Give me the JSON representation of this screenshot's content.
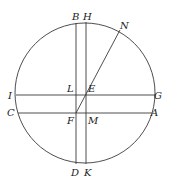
{
  "diagram": {
    "type": "geometric-construction",
    "circle": {
      "cx": 85,
      "cy": 93,
      "r": 70
    },
    "lines": [
      {
        "id": "BD",
        "x1": 76,
        "y1": 23,
        "x2": 76,
        "y2": 164
      },
      {
        "id": "HK",
        "x1": 86,
        "y1": 22,
        "x2": 86,
        "y2": 164
      },
      {
        "id": "IG",
        "x1": 16,
        "y1": 95,
        "x2": 155,
        "y2": 95
      },
      {
        "id": "CA",
        "x1": 18,
        "y1": 113,
        "x2": 152,
        "y2": 113
      },
      {
        "id": "FN",
        "x1": 76,
        "y1": 113,
        "x2": 120,
        "y2": 30
      }
    ],
    "labels": [
      {
        "id": "B",
        "text": "B",
        "x": 72,
        "y": 20
      },
      {
        "id": "H",
        "text": "H",
        "x": 83,
        "y": 20
      },
      {
        "id": "N",
        "text": "N",
        "x": 120,
        "y": 29
      },
      {
        "id": "I",
        "text": "I",
        "x": 8,
        "y": 99
      },
      {
        "id": "L",
        "text": "L",
        "x": 67,
        "y": 92
      },
      {
        "id": "E",
        "text": "E",
        "x": 88,
        "y": 92
      },
      {
        "id": "G",
        "text": "G",
        "x": 154,
        "y": 99
      },
      {
        "id": "C",
        "text": "C",
        "x": 7,
        "y": 116
      },
      {
        "id": "F",
        "text": "F",
        "x": 67,
        "y": 124
      },
      {
        "id": "M",
        "text": "M",
        "x": 88,
        "y": 124
      },
      {
        "id": "A",
        "text": "A",
        "x": 151,
        "y": 116
      },
      {
        "id": "D",
        "text": "D",
        "x": 71,
        "y": 176
      },
      {
        "id": "K",
        "text": "K",
        "x": 84,
        "y": 176
      }
    ]
  }
}
